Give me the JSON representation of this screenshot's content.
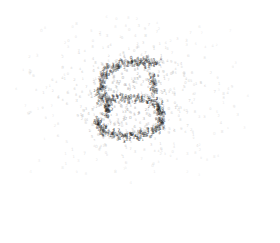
{
  "figure": {
    "width": 280,
    "height": 243,
    "background_color": "#ffffff",
    "title": "",
    "has_axes": false,
    "has_ticks": false,
    "has_legend": false,
    "has_gridlines": false,
    "has_border": false
  },
  "chart_data": {
    "type": "scatter",
    "title": "",
    "subtitle": "",
    "xlabel": "",
    "ylabel": "",
    "xlim": [
      0,
      280
    ],
    "ylim": [
      0,
      243
    ],
    "grid": false,
    "legend": null,
    "legend_position": "none",
    "annotations": [],
    "marker_style": "text-glyph",
    "marker_glyphs": [
      "5",
      "3",
      "8",
      "6",
      "2",
      "0",
      "9",
      "4",
      "1",
      "7"
    ],
    "marker_font_size_px": 3.2,
    "colors": {
      "core_dark": "#1a1a1a",
      "core_mid": "#555555",
      "halo": "#9a9a9a",
      "outlier": "#c4c4c4",
      "background": "#ffffff"
    },
    "series": [
      {
        "name": "digit-stroke-core",
        "color": "#1a1a1a",
        "point_count": 300,
        "glyph_weight": "dense",
        "shape": "digit-5",
        "center": [
          130,
          98
        ],
        "strokes": [
          {
            "name": "top-bar",
            "kind": "polyline",
            "points": [
              [
                106,
                72
              ],
              [
                118,
                66
              ],
              [
                133,
                63
              ],
              [
                148,
                63
              ],
              [
                158,
                65
              ]
            ],
            "thickness": 5,
            "density": 46
          },
          {
            "name": "upper-left-stem",
            "kind": "polyline",
            "points": [
              [
                106,
                72
              ],
              [
                103,
                82
              ],
              [
                101,
                92
              ],
              [
                101,
                101
              ]
            ],
            "thickness": 5,
            "density": 30
          },
          {
            "name": "middle-bar",
            "kind": "polyline",
            "points": [
              [
                101,
                101
              ],
              [
                116,
                99
              ],
              [
                132,
                99
              ],
              [
                146,
                101
              ],
              [
                156,
                105
              ]
            ],
            "thickness": 5,
            "density": 40
          },
          {
            "name": "bowl-right",
            "kind": "polyline",
            "points": [
              [
                156,
                105
              ],
              [
                162,
                113
              ],
              [
                162,
                122
              ],
              [
                157,
                130
              ]
            ],
            "thickness": 5,
            "density": 34
          },
          {
            "name": "bowl-bottom",
            "kind": "polyline",
            "points": [
              [
                157,
                130
              ],
              [
                145,
                136
              ],
              [
                130,
                138
              ],
              [
                115,
                136
              ],
              [
                105,
                131
              ]
            ],
            "thickness": 5,
            "density": 40
          },
          {
            "name": "bowl-left-tail",
            "kind": "polyline",
            "points": [
              [
                105,
                131
              ],
              [
                99,
                126
              ],
              [
                96,
                120
              ]
            ],
            "thickness": 4,
            "density": 18
          },
          {
            "name": "inner-left-tick",
            "kind": "polyline",
            "points": [
              [
                108,
                104
              ],
              [
                108,
                116
              ]
            ],
            "thickness": 4,
            "density": 16
          },
          {
            "name": "right-upper-accent",
            "kind": "polyline",
            "points": [
              [
                150,
                76
              ],
              [
                154,
                86
              ],
              [
                155,
                95
              ]
            ],
            "thickness": 4,
            "density": 18
          }
        ]
      },
      {
        "name": "halo-cluster",
        "color": "#9a9a9a",
        "point_count": 260,
        "glyph_weight": "medium",
        "distribution": "gaussian",
        "center": [
          130,
          98
        ],
        "spread": [
          34,
          30
        ]
      },
      {
        "name": "scattered-outliers",
        "color": "#c4c4c4",
        "point_count": 330,
        "glyph_weight": "light",
        "distribution": "gaussian",
        "center": [
          128,
          95
        ],
        "spread": [
          62,
          44
        ],
        "x_range": [
          14,
          248
        ],
        "y_range": [
          16,
          178
        ]
      }
    ]
  }
}
